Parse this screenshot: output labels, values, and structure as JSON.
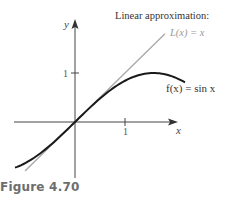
{
  "figure": {
    "caption": "Figure 4.70"
  },
  "labels": {
    "y_axis": "y",
    "x_axis": "x",
    "y_tick": "1",
    "x_tick": "1",
    "title_line1": "Linear approximation:",
    "line_label": "L(x) = x",
    "curve_label": "f(x) = sin x"
  },
  "colors": {
    "curve": "#1a1a1a",
    "line": "#a8a8a8",
    "axes": "#444444",
    "caption": "#6d6d6d"
  },
  "chart_data": {
    "type": "line",
    "title": "Linear approximation: L(x) = x",
    "xlabel": "x",
    "ylabel": "y",
    "xlim": [
      -1.2,
      2.0
    ],
    "ylim": [
      -1.1,
      2.1
    ],
    "x_ticks": [
      1
    ],
    "y_ticks": [
      1
    ],
    "grid": false,
    "legend": "inline annotations",
    "series": [
      {
        "name": "f(x) = sin x",
        "color": "#1a1a1a",
        "x": [
          -1.2,
          -0.9,
          -0.6,
          -0.3,
          0,
          0.3,
          0.6,
          0.9,
          1.2,
          1.5,
          1.8,
          2.2
        ],
        "values": [
          -0.932,
          -0.783,
          -0.565,
          -0.296,
          0,
          0.296,
          0.565,
          0.783,
          0.932,
          0.997,
          0.974,
          0.808
        ]
      },
      {
        "name": "L(x) = x",
        "color": "#a8a8a8",
        "x": [
          -1.0,
          1.8
        ],
        "values": [
          -1.0,
          1.8
        ]
      }
    ]
  }
}
